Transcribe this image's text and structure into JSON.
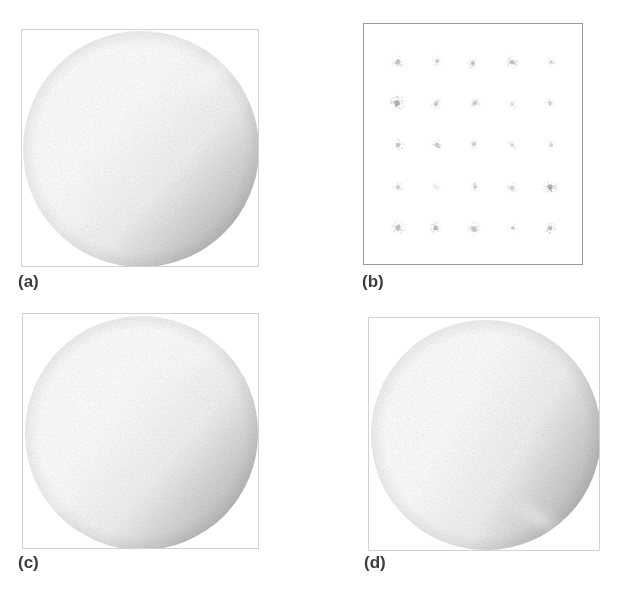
{
  "figure": {
    "background_color": "#ffffff",
    "width": 622,
    "height": 591,
    "layout": "2x2 panel grid",
    "label_color": "#3b3b3b"
  },
  "panels": [
    {
      "id": "a",
      "label": "(a)",
      "kind": "sphere",
      "frame": {
        "x": 21,
        "y": 29,
        "width": 238,
        "height": 238
      },
      "frame_border_color": "#d2d2d2",
      "frame_border_style": "faint",
      "label_pos": {
        "x": 18,
        "y": 272
      },
      "sphere": {
        "center_x": 0.5,
        "center_y": 0.5,
        "radius": 0.495,
        "highlight_x": 0.46,
        "highlight_y": 0.5,
        "highlight_radius": 0.42,
        "highlight_peak_color": "#ffffff",
        "mid_tone_color": "#bdbdbd",
        "rim_color": "#8a8a8a",
        "darkest_color": "#707070",
        "sheen": {
          "x": 0.78,
          "y": 0.2,
          "rx": 0.2,
          "ry": 0.07,
          "rotate": -34,
          "opacity": 0.72
        },
        "sheen2": {
          "x": 0.2,
          "y": 0.8,
          "rx": 0.15,
          "ry": 0.06,
          "rotate": -38,
          "opacity": 0.58
        },
        "shade_angle": 312,
        "grain_opacity": 0.3
      }
    },
    {
      "id": "b",
      "label": "(b)",
      "kind": "speckle-grid",
      "frame": {
        "x": 363,
        "y": 23,
        "width": 220,
        "height": 242
      },
      "frame_border_color": "#9a9a9a",
      "frame_border_style": "medium",
      "label_pos": {
        "x": 362,
        "y": 272
      },
      "grid": {
        "rows": 5,
        "cols": 5,
        "x_start": 0.155,
        "x_step": 0.1725,
        "y_start": 0.155,
        "y_step": 0.1725,
        "blob_base_size": 15,
        "blob_color": "#4a4a4a"
      },
      "blobs": [
        {
          "r": 0,
          "c": 0,
          "size": 16,
          "opacity": 0.62,
          "rot": 18,
          "jx": 0,
          "jy": 0
        },
        {
          "r": 0,
          "c": 1,
          "size": 13,
          "opacity": 0.46,
          "rot": -26,
          "jx": 1,
          "jy": -1
        },
        {
          "r": 0,
          "c": 2,
          "size": 15,
          "opacity": 0.5,
          "rot": 40,
          "jx": -1,
          "jy": 1
        },
        {
          "r": 0,
          "c": 3,
          "size": 15,
          "opacity": 0.66,
          "rot": -12,
          "jx": 0,
          "jy": 0
        },
        {
          "r": 0,
          "c": 4,
          "size": 11,
          "opacity": 0.44,
          "rot": 55,
          "jx": 1,
          "jy": 0
        },
        {
          "r": 1,
          "c": 0,
          "size": 18,
          "opacity": 0.74,
          "rot": -8,
          "jx": -1,
          "jy": 0
        },
        {
          "r": 1,
          "c": 1,
          "size": 14,
          "opacity": 0.56,
          "rot": 30,
          "jx": 0,
          "jy": 1
        },
        {
          "r": 1,
          "c": 2,
          "size": 14,
          "opacity": 0.52,
          "rot": -40,
          "jx": 1,
          "jy": 0
        },
        {
          "r": 1,
          "c": 3,
          "size": 14,
          "opacity": 0.3,
          "rot": 12,
          "jx": 0,
          "jy": 1
        },
        {
          "r": 1,
          "c": 4,
          "size": 14,
          "opacity": 0.42,
          "rot": -50,
          "jx": 0,
          "jy": 0
        },
        {
          "r": 2,
          "c": 0,
          "size": 15,
          "opacity": 0.6,
          "rot": 35,
          "jx": 0,
          "jy": 0
        },
        {
          "r": 2,
          "c": 1,
          "size": 14,
          "opacity": 0.5,
          "rot": -30,
          "jx": 1,
          "jy": 0
        },
        {
          "r": 2,
          "c": 2,
          "size": 14,
          "opacity": 0.48,
          "rot": 20,
          "jx": 0,
          "jy": -1
        },
        {
          "r": 2,
          "c": 3,
          "size": 12,
          "opacity": 0.46,
          "rot": -18,
          "jx": 0,
          "jy": 0
        },
        {
          "r": 2,
          "c": 4,
          "size": 13,
          "opacity": 0.44,
          "rot": 48,
          "jx": 1,
          "jy": 0
        },
        {
          "r": 3,
          "c": 0,
          "size": 13,
          "opacity": 0.5,
          "rot": -22,
          "jx": 0,
          "jy": 0
        },
        {
          "r": 3,
          "c": 1,
          "size": 12,
          "opacity": 0.22,
          "rot": 15,
          "jx": 0,
          "jy": 0
        },
        {
          "r": 3,
          "c": 2,
          "size": 12,
          "opacity": 0.54,
          "rot": -34,
          "jx": 1,
          "jy": 0
        },
        {
          "r": 3,
          "c": 3,
          "size": 15,
          "opacity": 0.48,
          "rot": 26,
          "jx": 0,
          "jy": 1
        },
        {
          "r": 3,
          "c": 4,
          "size": 17,
          "opacity": 0.82,
          "rot": -6,
          "jx": 0,
          "jy": 0
        },
        {
          "r": 4,
          "c": 0,
          "size": 17,
          "opacity": 0.62,
          "rot": 42,
          "jx": 0,
          "jy": 0
        },
        {
          "r": 4,
          "c": 1,
          "size": 15,
          "opacity": 0.7,
          "rot": -16,
          "jx": 0,
          "jy": 0
        },
        {
          "r": 4,
          "c": 2,
          "size": 18,
          "opacity": 0.58,
          "rot": 24,
          "jx": 0,
          "jy": 1
        },
        {
          "r": 4,
          "c": 3,
          "size": 12,
          "opacity": 0.48,
          "rot": -44,
          "jx": 1,
          "jy": 0
        },
        {
          "r": 4,
          "c": 4,
          "size": 15,
          "opacity": 0.66,
          "rot": 10,
          "jx": 0,
          "jy": 0
        }
      ]
    },
    {
      "id": "c",
      "label": "(c)",
      "kind": "sphere",
      "frame": {
        "x": 22,
        "y": 313,
        "width": 237,
        "height": 236
      },
      "frame_border_color": "#d2d2d2",
      "frame_border_style": "faint",
      "label_pos": {
        "x": 18,
        "y": 553
      },
      "sphere": {
        "center_x": 0.5,
        "center_y": 0.505,
        "radius": 0.495,
        "highlight_x": 0.4,
        "highlight_y": 0.53,
        "highlight_radius": 0.4,
        "highlight_peak_color": "#ffffff",
        "mid_tone_color": "#bcbcbc",
        "rim_color": "#8c8c8c",
        "darkest_color": "#767676",
        "sheen": {
          "x": 0.72,
          "y": 0.17,
          "rx": 0.21,
          "ry": 0.07,
          "rotate": -30,
          "opacity": 0.74
        },
        "sheen2": {
          "x": 0.16,
          "y": 0.78,
          "rx": 0.13,
          "ry": 0.06,
          "rotate": -42,
          "opacity": 0.6
        },
        "shade_angle": 310,
        "grain_opacity": 0.3
      }
    },
    {
      "id": "d",
      "label": "(d)",
      "kind": "sphere",
      "frame": {
        "x": 368,
        "y": 317,
        "width": 232,
        "height": 234
      },
      "frame_border_color": "#d2d2d2",
      "frame_border_style": "faint",
      "label_pos": {
        "x": 364,
        "y": 553
      },
      "sphere": {
        "center_x": 0.505,
        "center_y": 0.5,
        "radius": 0.495,
        "highlight_x": 0.47,
        "highlight_y": 0.45,
        "highlight_radius": 0.3,
        "highlight_peak_color": "#ffffff",
        "mid_tone_color": "#ababab",
        "rim_color": "#777777",
        "darkest_color": "#626262",
        "sheen": {
          "x": 0.46,
          "y": 0.12,
          "rx": 0.09,
          "ry": 0.05,
          "rotate": -12,
          "opacity": 0.8
        },
        "sheen2": {
          "x": 0.72,
          "y": 0.86,
          "rx": 0.16,
          "ry": 0.05,
          "rotate": 28,
          "opacity": 0.62
        },
        "shade_angle": 300,
        "grain_opacity": 0.32
      }
    }
  ]
}
